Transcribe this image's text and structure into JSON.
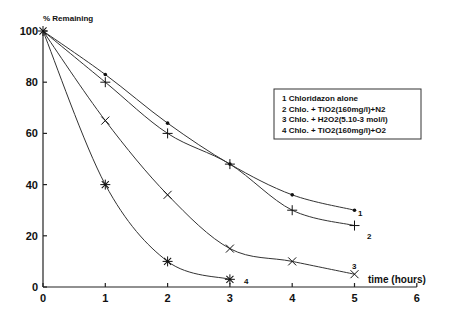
{
  "chart_data": {
    "type": "line",
    "title": "",
    "ylabel": "% Remaining",
    "xlabel": "time (hours)",
    "xlim": [
      0,
      6
    ],
    "ylim": [
      0,
      100
    ],
    "x_ticks": [
      0,
      1,
      2,
      3,
      4,
      5,
      6
    ],
    "y_ticks": [
      0,
      20,
      40,
      60,
      80,
      100
    ],
    "grid": false,
    "legend_position": "upper right (boxed)",
    "legend": [
      "1 Chloridazon alone",
      "2 Chlo. + TiO2(160mg/l)+N2",
      "3 Chlo. + H2O2(5.10-3 mol/l)",
      "4 Chlo. + TiO2(160mg/l)+O2"
    ],
    "series": [
      {
        "name": "1 Chloridazon alone",
        "label": "1",
        "marker": "dot",
        "x": [
          0,
          1,
          2,
          3,
          4,
          5
        ],
        "values": [
          100,
          83,
          64,
          48,
          36,
          30
        ]
      },
      {
        "name": "2 Chlo. + TiO2(160mg/l)+N2",
        "label": "2",
        "marker": "plus",
        "x": [
          0,
          1,
          2,
          3,
          4,
          5
        ],
        "values": [
          100,
          80,
          60,
          48,
          30,
          24
        ]
      },
      {
        "name": "3 Chlo. + H2O2(5.10-3 mol/l)",
        "label": "3",
        "marker": "cross",
        "x": [
          0,
          1,
          2,
          3,
          4,
          5
        ],
        "values": [
          100,
          65,
          36,
          15,
          10,
          5
        ]
      },
      {
        "name": "4 Chlo. + TiO2(160mg/l)+O2",
        "label": "4",
        "marker": "asterisk",
        "x": [
          0,
          1,
          2,
          3
        ],
        "values": [
          100,
          40,
          10,
          3
        ]
      }
    ]
  }
}
